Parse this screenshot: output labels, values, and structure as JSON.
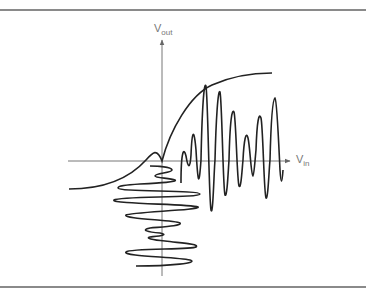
{
  "diagram": {
    "axes": {
      "y_label_main": "V",
      "y_label_sub": "out",
      "x_label_main": "V",
      "x_label_sub": "in"
    },
    "colors": {
      "curve": "#222222",
      "axis": "#777777",
      "border": "#8a8a8a",
      "background": "#ffffff"
    },
    "elements": [
      "transfer-curve",
      "input-waveform",
      "output-waveform",
      "x-axis",
      "y-axis"
    ]
  }
}
